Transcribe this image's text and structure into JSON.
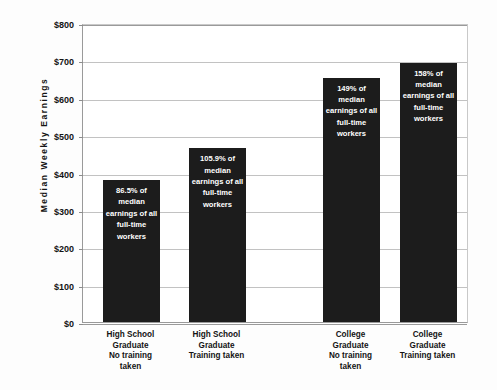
{
  "chart_data": {
    "type": "bar",
    "title": "",
    "subtitle": "",
    "xlabel": "",
    "ylabel": "Median Weekly Earnings",
    "ylim": [
      0,
      800
    ],
    "grid": true,
    "legend": null,
    "y_ticks": [
      "$0",
      "$100",
      "$200",
      "$300",
      "$400",
      "$500",
      "$600",
      "$700",
      "$800"
    ],
    "y_tick_values": [
      0,
      100,
      200,
      300,
      400,
      500,
      600,
      700,
      800
    ],
    "categories": [
      "High School Graduate No training taken",
      "High School Graduate Training taken",
      "College Graduate No training taken",
      "College Graduate Training taken"
    ],
    "values": [
      380,
      465,
      654,
      694
    ],
    "data_labels": [
      "$380",
      "$465",
      "$654",
      "$694"
    ],
    "bar_color": "#1c1c1c",
    "bar_text_color": "#ffffff",
    "annotations": [
      "86.5% of median earnings of all full-time workers",
      "105.9% of median earnings of all full-time workers",
      "149% of median earnings of all full-time workers",
      "158% of median earnings of all full-time workers"
    ]
  },
  "axis": {
    "y_title": "Median Weekly Earnings"
  },
  "bars": [
    {
      "value_label": "$380",
      "inner_text": "86.5% of median earnings of all full-time workers",
      "category_line1": "High School",
      "category_line2": "Graduate",
      "category_line3": "No training",
      "category_line4": "taken"
    },
    {
      "value_label": "$465",
      "inner_text": "105.9% of median earnings of all full-time workers",
      "category_line1": "High School",
      "category_line2": "Graduate",
      "category_line3": "Training taken",
      "category_line4": ""
    },
    {
      "value_label": "$654",
      "inner_text": "149% of median earnings of all full-time workers",
      "category_line1": "College",
      "category_line2": "Graduate",
      "category_line3": "No training",
      "category_line4": "taken"
    },
    {
      "value_label": "$694",
      "inner_text": "158% of median earnings of all full-time workers",
      "category_line1": "College",
      "category_line2": "Graduate",
      "category_line3": "Training taken",
      "category_line4": ""
    }
  ],
  "y_labels": {
    "t0": "$0",
    "t1": "$100",
    "t2": "$200",
    "t3": "$300",
    "t4": "$400",
    "t5": "$500",
    "t6": "$600",
    "t7": "$700",
    "t8": "$800"
  }
}
